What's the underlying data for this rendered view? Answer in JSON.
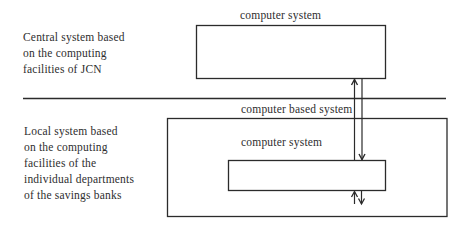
{
  "central_section": {
    "description_lines": [
      "Central system based",
      "on the computing",
      "facilities of JCN"
    ],
    "box_label": "computer system"
  },
  "local_section": {
    "description_lines": [
      "Local system based",
      "on the computing",
      "facilities of the",
      "individual departments",
      "of the savings banks"
    ],
    "outer_box_label": "computer based system",
    "inner_box_label": "computer system"
  },
  "colors": {
    "line": "#2b2b2b",
    "text": "#2e2e2e",
    "background": "#ffffff"
  }
}
